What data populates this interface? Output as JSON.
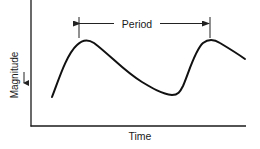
{
  "diagram": {
    "xaxis_label": "Time",
    "yaxis_label": "Magnitude",
    "yaxis_arrow": "down-arrow",
    "period_label": "Period",
    "period_indicator": "double-headed arrow spanning peak to peak",
    "colors": {
      "line": "#111111",
      "text": "#1a1a1a",
      "background": "#ffffff"
    },
    "curve_description": "rises to a first peak, falls gradually to a trough, rises steeply to a second peak, then begins to fall again"
  }
}
